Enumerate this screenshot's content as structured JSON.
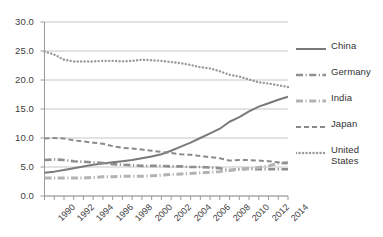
{
  "chart_data": {
    "type": "line",
    "title": "",
    "subtitle": "",
    "xlabel": "",
    "ylabel": "",
    "xlim": [
      1990,
      2015
    ],
    "ylim": [
      0.0,
      30.0
    ],
    "grid": true,
    "grid_axis": "y",
    "legend_position": "right",
    "x": [
      1990,
      1991,
      1992,
      1993,
      1994,
      1995,
      1996,
      1997,
      1998,
      1999,
      2000,
      2001,
      2002,
      2003,
      2004,
      2005,
      2006,
      2007,
      2008,
      2009,
      2010,
      2011,
      2012,
      2013,
      2014,
      2015
    ],
    "ytick_labels": [
      "0.0",
      "5.0",
      "10.0",
      "15.0",
      "20.0",
      "25.0",
      "30.0"
    ],
    "ytick_values": [
      0.0,
      5.0,
      10.0,
      15.0,
      20.0,
      25.0,
      30.0
    ],
    "xtick_labels": [
      "1990",
      "1992",
      "1994",
      "1996",
      "1998",
      "2000",
      "2002",
      "2004",
      "2014"
    ],
    "xtick_label_values": [
      1990,
      1992,
      1994,
      1996,
      1998,
      2000,
      2002,
      2004,
      2014
    ],
    "xtick_labels_all": [
      "1990",
      "1992",
      "1994",
      "1996",
      "1998",
      "2000",
      "2002",
      "2004",
      "2006",
      "2008",
      "2010",
      "2012",
      "2014"
    ],
    "xtick_label_values_all": [
      1990,
      1992,
      1994,
      1996,
      1998,
      2000,
      2002,
      2004,
      2006,
      2008,
      2010,
      2012,
      2014
    ],
    "series": [
      {
        "name": "China",
        "style": "solid",
        "color": "#7a7a7a",
        "width": 2.0,
        "values": [
          4.0,
          4.2,
          4.5,
          4.8,
          5.1,
          5.4,
          5.6,
          5.8,
          6.0,
          6.2,
          6.5,
          6.8,
          7.2,
          7.8,
          8.5,
          9.2,
          10.0,
          10.8,
          11.6,
          12.8,
          13.6,
          14.6,
          15.4,
          16.0,
          16.6,
          17.1
        ]
      },
      {
        "name": "Germany",
        "style": "dash-dot",
        "color": "#8f8f8f",
        "width": 2.6,
        "values": [
          6.2,
          6.3,
          6.2,
          6.0,
          5.9,
          5.8,
          5.7,
          5.5,
          5.4,
          5.3,
          5.2,
          5.2,
          5.2,
          5.1,
          5.1,
          5.0,
          5.0,
          4.9,
          4.8,
          4.4,
          4.6,
          4.7,
          4.6,
          4.6,
          4.6,
          4.6
        ]
      },
      {
        "name": "India",
        "style": "dash-dot",
        "color": "#b3b3b3",
        "width": 3.0,
        "values": [
          3.1,
          3.1,
          3.1,
          3.1,
          3.1,
          3.2,
          3.3,
          3.3,
          3.4,
          3.4,
          3.4,
          3.5,
          3.6,
          3.7,
          3.8,
          3.9,
          4.0,
          4.1,
          4.2,
          4.5,
          4.6,
          4.7,
          4.9,
          5.2,
          5.6,
          5.8
        ]
      },
      {
        "name": "Japan",
        "style": "dashed",
        "color": "#8a8a8a",
        "width": 2.0,
        "values": [
          9.9,
          10.0,
          9.9,
          9.6,
          9.4,
          9.2,
          9.0,
          8.6,
          8.3,
          8.2,
          8.0,
          7.8,
          7.6,
          7.4,
          7.2,
          7.1,
          6.9,
          6.7,
          6.5,
          6.1,
          6.2,
          6.2,
          6.1,
          6.0,
          5.8,
          5.6
        ]
      },
      {
        "name": "United States",
        "style": "dotted",
        "color": "#9a9a9a",
        "width": 2.4,
        "values": [
          24.9,
          24.4,
          23.5,
          23.2,
          23.2,
          23.2,
          23.3,
          23.3,
          23.2,
          23.3,
          23.5,
          23.4,
          23.3,
          23.1,
          22.9,
          22.6,
          22.2,
          22.0,
          21.5,
          20.9,
          20.6,
          20.1,
          19.6,
          19.4,
          19.1,
          18.8
        ]
      }
    ],
    "legend_entries": [
      {
        "label": "China",
        "style": "solid",
        "color": "#7a7a7a"
      },
      {
        "label": "Germany",
        "style": "dash-dot",
        "color": "#8f8f8f"
      },
      {
        "label": "India",
        "style": "dash-dot",
        "color": "#b3b3b3"
      },
      {
        "label": "Japan",
        "style": "dashed",
        "color": "#8a8a8a"
      },
      {
        "label": "United States",
        "style": "dotted",
        "color": "#9a9a9a"
      }
    ]
  },
  "axes": {
    "y_axis_color": "#9a9a9a",
    "x_axis_color": "#9a9a9a",
    "gridline_color": "#b8b8b8"
  }
}
